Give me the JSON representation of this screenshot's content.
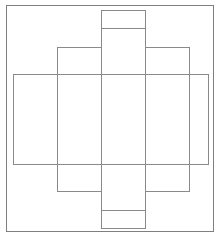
{
  "diagram": {
    "type": "box-net",
    "colors": {
      "background": "#ffffff",
      "stroke": "#8a8a8a",
      "frame": "#7f7f7f"
    },
    "shapes": [
      {
        "name": "outer-frame",
        "x": 6.5,
        "y": 5.5,
        "w": 207,
        "h": 226
      },
      {
        "name": "wide-horizontal-panel",
        "x": 13.5,
        "y": 74.5,
        "w": 195,
        "h": 90
      },
      {
        "name": "left-side-panel",
        "x": 57.5,
        "y": 47.5,
        "w": 44,
        "h": 144
      },
      {
        "name": "right-side-panel",
        "x": 145.5,
        "y": 47.5,
        "w": 44,
        "h": 144
      },
      {
        "name": "center-column",
        "x": 101.5,
        "y": 10.5,
        "w": 44,
        "h": 218
      }
    ],
    "lines": [
      {
        "name": "center-top-flap-line",
        "x1": 101.5,
        "y1": 28.5,
        "x2": 145.5,
        "y2": 28.5
      },
      {
        "name": "center-bottom-flap-line",
        "x1": 101.5,
        "y1": 210.5,
        "x2": 145.5,
        "y2": 210.5
      }
    ]
  }
}
